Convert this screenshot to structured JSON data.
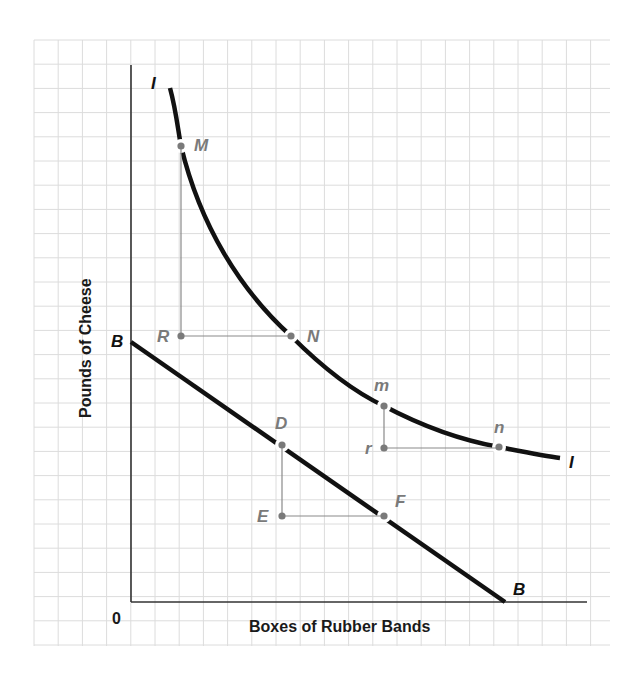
{
  "diagram": {
    "type": "indifference-curve-budget-line",
    "axes": {
      "x_label": "Boxes of Rubber Bands",
      "y_label": "Pounds of Cheese",
      "origin_label": "0"
    },
    "curves": {
      "indifference": {
        "label_start": "I",
        "label_end": "I"
      },
      "budget": {
        "label_start": "B",
        "label_end": "B"
      }
    },
    "points": {
      "M": "M",
      "N": "N",
      "R": "R",
      "m": "m",
      "n": "n",
      "r": "r",
      "D": "D",
      "E": "E",
      "F": "F"
    },
    "colors": {
      "curve": "#111111",
      "point": "#7a7a7a",
      "label": "#7a7a7a",
      "grid": "#d9d9d9",
      "axis": "#333333"
    }
  }
}
